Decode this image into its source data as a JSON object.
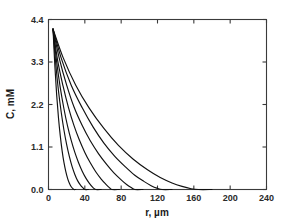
{
  "chart_data": {
    "type": "line",
    "title": "",
    "subtitle": "",
    "xlabel": "r, µm",
    "ylabel": "C, mM",
    "xlim": [
      0,
      240
    ],
    "ylim": [
      0.0,
      4.4
    ],
    "xticks": [
      0,
      40,
      80,
      120,
      160,
      200,
      240
    ],
    "xtick_labels": [
      "0",
      "40",
      "80",
      "120",
      "160",
      "200",
      "240"
    ],
    "yticks": [
      0.0,
      1.1,
      2.2,
      3.3,
      4.4
    ],
    "ytick_labels": [
      "0.0",
      "1.1",
      "2.2",
      "3.3",
      "4.4"
    ],
    "grid": false,
    "legend": "none",
    "legend_entries": [],
    "annotations": [],
    "series_color": "#111111",
    "frame_color": "#3a3a3a",
    "series": [
      {
        "name": "curve-1",
        "decay_end_um": 28,
        "x": [
          5,
          7,
          9,
          11,
          13,
          15,
          17,
          19,
          21,
          23,
          25,
          27,
          28,
          30
        ],
        "y": [
          4.15,
          3.2,
          2.45,
          1.85,
          1.38,
          1.0,
          0.7,
          0.47,
          0.29,
          0.16,
          0.07,
          0.02,
          0.0,
          0.0
        ]
      },
      {
        "name": "curve-2",
        "decay_end_um": 40,
        "x": [
          5,
          8,
          11,
          14,
          17,
          20,
          23,
          26,
          29,
          32,
          35,
          38,
          40,
          44
        ],
        "y": [
          4.15,
          3.25,
          2.55,
          2.0,
          1.54,
          1.16,
          0.85,
          0.59,
          0.39,
          0.23,
          0.12,
          0.04,
          0.0,
          0.0
        ]
      },
      {
        "name": "curve-3",
        "decay_end_um": 52,
        "x": [
          5,
          9,
          13,
          17,
          21,
          25,
          29,
          33,
          37,
          41,
          45,
          49,
          52,
          58
        ],
        "y": [
          4.15,
          3.3,
          2.63,
          2.09,
          1.64,
          1.27,
          0.96,
          0.7,
          0.48,
          0.3,
          0.16,
          0.05,
          0.0,
          0.0
        ]
      },
      {
        "name": "curve-4",
        "decay_end_um": 70,
        "x": [
          5,
          10,
          16,
          22,
          28,
          34,
          40,
          46,
          52,
          58,
          63,
          67,
          70,
          78
        ],
        "y": [
          4.15,
          3.35,
          2.68,
          2.12,
          1.66,
          1.28,
          0.96,
          0.69,
          0.46,
          0.27,
          0.14,
          0.05,
          0.0,
          0.0
        ]
      },
      {
        "name": "curve-5",
        "decay_end_um": 95,
        "x": [
          5,
          12,
          20,
          28,
          37,
          46,
          55,
          64,
          72,
          80,
          86,
          91,
          95,
          104
        ],
        "y": [
          4.15,
          3.38,
          2.7,
          2.14,
          1.66,
          1.26,
          0.93,
          0.65,
          0.43,
          0.25,
          0.13,
          0.05,
          0.0,
          0.0
        ]
      },
      {
        "name": "curve-6",
        "decay_end_um": 125,
        "x": [
          5,
          14,
          25,
          37,
          49,
          61,
          73,
          85,
          95,
          105,
          113,
          120,
          125,
          136
        ],
        "y": [
          4.15,
          3.4,
          2.7,
          2.12,
          1.62,
          1.2,
          0.86,
          0.58,
          0.37,
          0.21,
          0.1,
          0.03,
          0.0,
          0.0
        ]
      },
      {
        "name": "curve-7",
        "decay_end_um": 165,
        "x": [
          5,
          16,
          30,
          45,
          61,
          77,
          93,
          109,
          123,
          136,
          147,
          157,
          165,
          180
        ],
        "y": [
          4.15,
          3.42,
          2.7,
          2.1,
          1.58,
          1.14,
          0.79,
          0.51,
          0.31,
          0.17,
          0.08,
          0.02,
          0.0,
          0.0
        ]
      }
    ]
  },
  "axes": {
    "x_axis_title": "r, µm",
    "y_axis_title": "C, mM"
  }
}
